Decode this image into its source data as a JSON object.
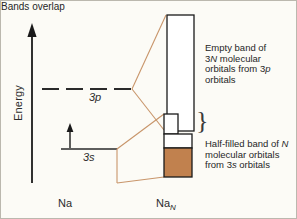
{
  "figure": {
    "background_color": "#fcfbf6",
    "border_color": "#bbb8ae",
    "line_color": "#1a1a1a",
    "connector_color": "#c8956a",
    "filled_band_color": "#c1814e",
    "empty_band_color": "#ffffff"
  },
  "axis": {
    "label": "Energy",
    "direction": "up",
    "arrow_icon": "up-arrow-icon"
  },
  "atom_levels": [
    {
      "id": "3p",
      "label": "3p",
      "style": "dashed",
      "occupancy": "empty",
      "y": 88
    },
    {
      "id": "3s",
      "label": "3s",
      "style": "solid",
      "occupancy": "one electron",
      "electron_arrow_icon": "electron-up-arrow-icon",
      "y": 148
    }
  ],
  "bands": [
    {
      "id": "band-3p",
      "fill": "empty",
      "description": "Empty band of\n3N molecular\norbitals from 3p\norbitals",
      "description_plain": "Empty band of 3N molecular orbitals from 3p orbitals",
      "italic_terms": [
        "N",
        "p"
      ]
    },
    {
      "id": "band-3s",
      "fill": "half-filled",
      "description": "Half-filled band of N\nmolecular orbitals\nfrom 3s orbitals",
      "description_plain": "Half-filled band of N molecular orbitals from 3s orbitals",
      "italic_terms": [
        "N",
        "s"
      ]
    }
  ],
  "overlap": {
    "label": "Bands overlap",
    "brace_glyph": "}"
  },
  "x_axis_labels": {
    "left": "Na",
    "right_base": "Na",
    "right_subscript": "N"
  }
}
